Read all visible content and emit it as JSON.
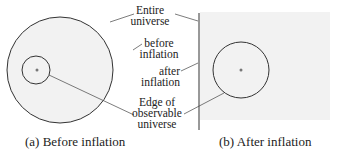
{
  "labels": {
    "entire_universe": [
      "Entire",
      "universe"
    ],
    "before_inflation": [
      "before",
      "inflation"
    ],
    "after_inflation": [
      "after",
      "inflation"
    ],
    "edge_observable": [
      "Edge of",
      "observable",
      "universe"
    ]
  },
  "captions": {
    "a": "(a) Before inflation",
    "b": "(b) After inflation"
  },
  "colors": {
    "fill": "#f2f2f2",
    "stroke": "#333333"
  }
}
